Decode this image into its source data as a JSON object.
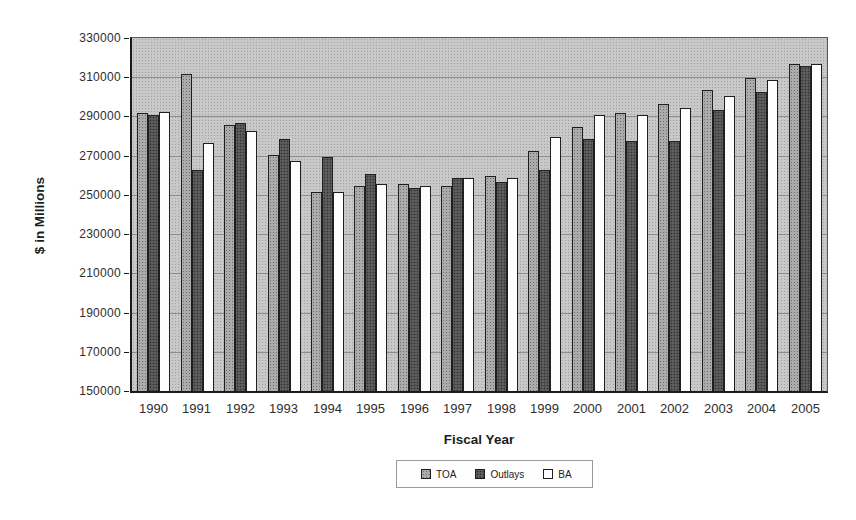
{
  "chart_data": {
    "type": "bar",
    "title": "",
    "xlabel": "Fiscal Year",
    "ylabel": "$ in Millions",
    "categories": [
      "1990",
      "1991",
      "1992",
      "1993",
      "1994",
      "1995",
      "1996",
      "1997",
      "1998",
      "1999",
      "2000",
      "2001",
      "2002",
      "2003",
      "2004",
      "2005"
    ],
    "series": [
      {
        "name": "TOA",
        "values": [
          291000,
          311000,
          285000,
          270000,
          251000,
          254000,
          255000,
          254000,
          259000,
          272000,
          284000,
          291000,
          296000,
          303000,
          309000,
          316000
        ]
      },
      {
        "name": "Outlays",
        "values": [
          290000,
          262000,
          286000,
          278000,
          269000,
          260000,
          253000,
          258000,
          256000,
          262000,
          278000,
          277000,
          277000,
          293000,
          302000,
          315000
        ]
      },
      {
        "name": "BA",
        "values": [
          292000,
          276000,
          282000,
          267000,
          251000,
          255000,
          254000,
          258000,
          258000,
          279000,
          290000,
          290000,
          294000,
          300000,
          308000,
          316000
        ]
      }
    ],
    "ylim": [
      150000,
      330000
    ],
    "yticks": [
      150000,
      170000,
      190000,
      210000,
      230000,
      250000,
      270000,
      290000,
      310000,
      330000
    ],
    "grid": true,
    "legend_position": "bottom"
  },
  "colors": {
    "toa": "#ababab",
    "outlays": "#5f5f5f",
    "ba": "#fdfdfd",
    "plot_bg": "#c8c8c8",
    "plot_dot": "#a2a2a2",
    "grid": "#8c8c8c",
    "axis": "#1a1a1a"
  }
}
